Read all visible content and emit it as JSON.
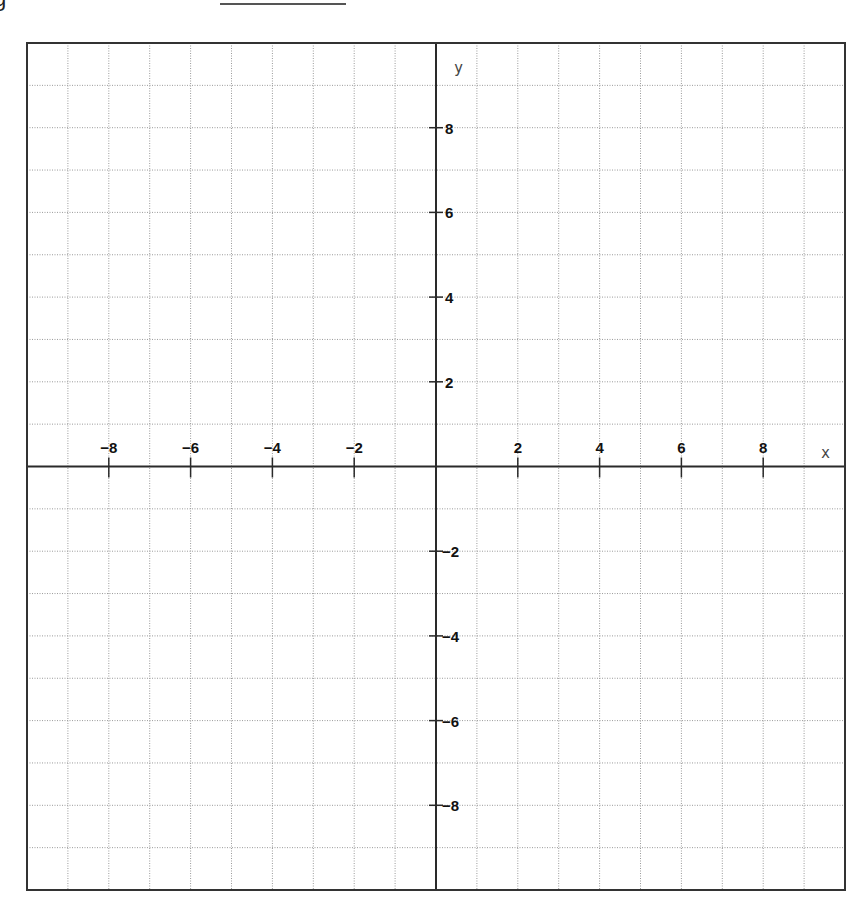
{
  "header": {
    "partial_glyph": "g",
    "answer_blank": ""
  },
  "chart_data": {
    "type": "scatter",
    "title": "",
    "xlabel": "x",
    "ylabel": "y",
    "xlim": [
      -10,
      10
    ],
    "ylim": [
      -10,
      10
    ],
    "grid": true,
    "grid_step": 1,
    "x_tick_labels": [
      "-8",
      "-6",
      "-4",
      "-2",
      "2",
      "4",
      "6",
      "8"
    ],
    "x_tick_values": [
      -8,
      -6,
      -4,
      -2,
      2,
      4,
      6,
      8
    ],
    "y_tick_labels": [
      "8",
      "6",
      "4",
      "2",
      "-2",
      "-4",
      "-6",
      "-8"
    ],
    "y_tick_values": [
      8,
      6,
      4,
      2,
      -2,
      -4,
      -6,
      -8
    ],
    "series": []
  },
  "layout": {
    "frame": {
      "left": 27,
      "top": 43,
      "right": 845,
      "bottom": 890
    },
    "colors": {
      "axis": "#2a2a2a",
      "grid": "#9a9a9a",
      "background": "#ffffff"
    }
  }
}
